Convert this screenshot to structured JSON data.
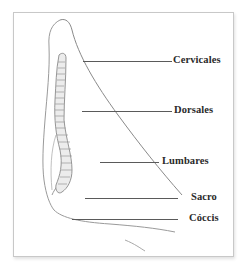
{
  "figure": {
    "labels": [
      {
        "id": "cervicales",
        "text": "Cervicales",
        "x": 173,
        "y": 54,
        "line_x1": 83,
        "line_x2": 172,
        "line_y": 61
      },
      {
        "id": "dorsales",
        "text": "Dorsales",
        "x": 174,
        "y": 104,
        "line_x1": 82,
        "line_x2": 172,
        "line_y": 111
      },
      {
        "id": "lumbares",
        "text": "Lumbares",
        "x": 163,
        "y": 155,
        "line_x1": 100,
        "line_x2": 159,
        "line_y": 162
      },
      {
        "id": "sacro",
        "text": "Sacro",
        "x": 191,
        "y": 191,
        "line_x1": 85,
        "line_x2": 178,
        "line_y": 198
      },
      {
        "id": "coccis",
        "text": "Cóccis",
        "x": 189,
        "y": 212,
        "line_x1": 72,
        "line_x2": 178,
        "line_y": 219
      }
    ],
    "colors": {
      "frame": "#c8c8c8",
      "outline": "#8a8a8a",
      "spine_fill": "#e8e8e8",
      "text": "#2a2a2a",
      "leader": "#5a5a5a"
    }
  }
}
